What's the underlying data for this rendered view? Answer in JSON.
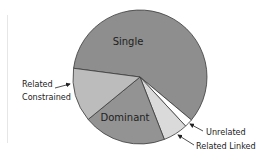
{
  "chart_data": {
    "type": "pie",
    "title": "",
    "categories": [
      "Single",
      "Unrelated",
      "Related Linked",
      "Dominant",
      "Related Constrained"
    ],
    "values": [
      59,
      2,
      6,
      20,
      13
    ],
    "colors": [
      "#8e8e8e",
      "#ffffff",
      "#dadada",
      "#939393",
      "#bcbcbc"
    ],
    "labels": {
      "single": "Single",
      "dominant": "Dominant",
      "related_constrained_line1": "Related",
      "related_constrained_line2": "Constrained",
      "unrelated": "Unrelated",
      "related_linked": "Related Linked"
    },
    "label_placement": {
      "Single": "inside",
      "Dominant": "inside",
      "Related Constrained": "outside-left with arrow",
      "Unrelated": "outside-right with arrow",
      "Related Linked": "outside-right with arrow"
    },
    "legend": "none"
  }
}
